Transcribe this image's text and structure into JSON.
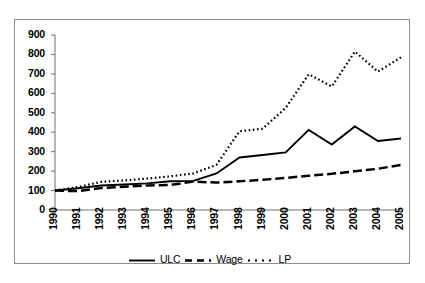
{
  "chart_data": {
    "type": "line",
    "title": "",
    "subtitle": "",
    "xlabel": "",
    "ylabel": "",
    "categories": [
      "1990",
      "1991",
      "1992",
      "1993",
      "1994",
      "1995",
      "1996",
      "1997",
      "1998",
      "1999",
      "2000",
      "2001",
      "2002",
      "2003",
      "2004",
      "2005"
    ],
    "x_tick_labels": [
      "1990",
      "1991",
      "1992",
      "1993",
      "1994",
      "1995",
      "1996",
      "1997",
      "1998",
      "1999",
      "2000",
      "2001",
      "2002",
      "2003",
      "2004",
      "2005"
    ],
    "y_tick_labels": [
      "0",
      "100",
      "200",
      "300",
      "400",
      "500",
      "600",
      "700",
      "800",
      "900"
    ],
    "y_ticks": [
      0,
      100,
      200,
      300,
      400,
      500,
      600,
      700,
      800,
      900
    ],
    "ylim": [
      0,
      900
    ],
    "grid": false,
    "legend_position": "bottom",
    "series": [
      {
        "name": "ULC",
        "style": "solid",
        "color": "#000000",
        "values": [
          100,
          112,
          126,
          131,
          137,
          148,
          150,
          188,
          270,
          283,
          296,
          412,
          337,
          430,
          355,
          368
        ]
      },
      {
        "name": "Wage",
        "style": "dashed",
        "color": "#000000",
        "values": [
          100,
          97,
          113,
          120,
          126,
          129,
          146,
          141,
          148,
          155,
          165,
          176,
          186,
          199,
          212,
          232
        ]
      },
      {
        "name": "LP",
        "style": "dotted",
        "color": "#000000",
        "values": [
          100,
          118,
          145,
          152,
          162,
          173,
          188,
          232,
          405,
          418,
          525,
          698,
          635,
          815,
          712,
          785
        ]
      }
    ]
  },
  "legend": {
    "items": [
      {
        "label": "ULC",
        "style": "solid"
      },
      {
        "label": "Wage",
        "style": "dashed"
      },
      {
        "label": "LP",
        "style": "dotted"
      }
    ]
  },
  "axes": {
    "y_axis_name": "value-axis",
    "x_axis_name": "year-axis"
  }
}
